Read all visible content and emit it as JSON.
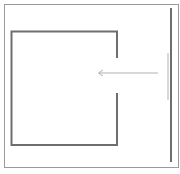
{
  "diagram": {
    "colors": {
      "frame": "#9a9a9a",
      "shape": "#6e6e6e",
      "wall": "#6e6e6e",
      "arrow": "#b0b0b0",
      "wall_highlight": "#d8d8d8"
    }
  }
}
